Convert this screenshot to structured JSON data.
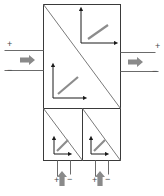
{
  "diagram": {
    "type": "block-schematic",
    "canvas": {
      "width": 164,
      "height": 196
    },
    "colors": {
      "outline": "#3a3a3a",
      "diagonal": "#7a7a7a",
      "axis": "#1a1a1a",
      "curve": "#8c8c8c",
      "flow_arrow": "#8a8a8a",
      "terminal_line": "#6b6b6b",
      "sign_text": "#4a4a4a",
      "background": "#ffffff"
    },
    "blocks": [
      {
        "id": "upper-cell",
        "name": "upper-converter-cell",
        "x": 43,
        "y": 4,
        "width": 77,
        "height": 104,
        "diagonal": "top-left-to-bottom-right"
      },
      {
        "id": "lower-left-cell",
        "name": "lower-left-converter-cell",
        "x": 43,
        "y": 108,
        "width": 39,
        "height": 52,
        "diagonal": "top-left-to-bottom-right"
      },
      {
        "id": "lower-right-cell",
        "name": "lower-right-converter-cell",
        "x": 82,
        "y": 108,
        "width": 38,
        "height": 52,
        "diagonal": "top-left-to-bottom-right"
      }
    ],
    "curve_icons": [
      {
        "id": "icon-upper-right",
        "name": "characteristic-curve-icon-upper-right",
        "slope": "positive",
        "axis_origin_x": 81,
        "axis_origin_y": 43,
        "axis_height": 34,
        "axis_width": 35,
        "curve": {
          "x1": 88,
          "y1": 39,
          "x2": 108,
          "y2": 25
        }
      },
      {
        "id": "icon-middle-left",
        "name": "characteristic-curve-icon-middle-left",
        "slope": "positive",
        "axis_origin_x": 53,
        "axis_origin_y": 98,
        "axis_height": 33,
        "axis_width": 32,
        "curve": {
          "x1": 58,
          "y1": 94,
          "x2": 78,
          "y2": 77
        }
      },
      {
        "id": "icon-lower-left",
        "name": "characteristic-curve-icon-lower-left",
        "slope": "negative",
        "axis_origin_x": 54,
        "axis_origin_y": 154,
        "axis_height": 16,
        "axis_width": 16,
        "curve": {
          "x1": 57,
          "y1": 151,
          "x2": 68,
          "y2": 140
        }
      },
      {
        "id": "icon-lower-right",
        "name": "characteristic-curve-icon-lower-right",
        "slope": "negative",
        "axis_origin_x": 91,
        "axis_origin_y": 154,
        "axis_height": 16,
        "axis_width": 16,
        "curve": {
          "x1": 94,
          "y1": 151,
          "x2": 105,
          "y2": 140
        }
      }
    ],
    "ports": {
      "left": {
        "name": "left-port",
        "positive_label": "+",
        "negative_label": "−",
        "flow_direction": "right",
        "positive_line": {
          "x1": 4,
          "y1": 50,
          "x2": 43,
          "y2": 50
        },
        "negative_line": {
          "x1": 4,
          "y1": 70,
          "x2": 43,
          "y2": 70
        },
        "plus_pos": {
          "x": 7,
          "y": 47
        },
        "minus_pos": {
          "x": 7,
          "y": 73
        },
        "arrow": {
          "x": 20,
          "y": 60
        }
      },
      "right": {
        "name": "right-port",
        "positive_label": "+",
        "negative_label": "−",
        "flow_direction": "right",
        "positive_line": {
          "x1": 120,
          "y1": 52,
          "x2": 155,
          "y2": 52
        },
        "negative_line": {
          "x1": 120,
          "y1": 71,
          "x2": 158,
          "y2": 71
        },
        "plus_pos": {
          "x": 155,
          "y": 49
        },
        "minus_pos": {
          "x": 152,
          "y": 74
        },
        "arrow": {
          "x": 128,
          "y": 62
        }
      },
      "bottom_left": {
        "name": "bottom-left-port",
        "positive_label": "+",
        "negative_label": "−",
        "flow_direction": "up",
        "positive_line": {
          "x1": 57,
          "y1": 160,
          "x2": 57,
          "y2": 176
        },
        "negative_line": {
          "x1": 70,
          "y1": 160,
          "x2": 70,
          "y2": 174
        },
        "plus_pos": {
          "x": 54,
          "y": 183
        },
        "minus_pos": {
          "x": 67,
          "y": 182
        },
        "arrow": {
          "x": 62,
          "y": 186
        }
      },
      "bottom_right": {
        "name": "bottom-right-port",
        "positive_label": "+",
        "negative_label": "−",
        "flow_direction": "up",
        "positive_line": {
          "x1": 95,
          "y1": 160,
          "x2": 95,
          "y2": 176
        },
        "negative_line": {
          "x1": 108,
          "y1": 160,
          "x2": 108,
          "y2": 174
        },
        "plus_pos": {
          "x": 92,
          "y": 183
        },
        "minus_pos": {
          "x": 105,
          "y": 182
        },
        "arrow": {
          "x": 100,
          "y": 186
        }
      }
    }
  }
}
